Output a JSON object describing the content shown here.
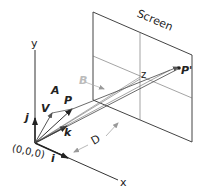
{
  "diagram": {
    "screen_label": "Screen",
    "axes": {
      "x": "x",
      "y": "y",
      "z": "z"
    },
    "origin_label": "(0,0,0)",
    "unit_vectors": {
      "i": "i",
      "j": "j",
      "k": "k"
    },
    "vectors": {
      "A": "A",
      "V": "V",
      "P": "P",
      "B": "B",
      "P_prime": "P'"
    },
    "distance_label": "D",
    "colors": {
      "line": "#333333",
      "faded": "#bbbbbb",
      "screen_edge": "#444444"
    }
  }
}
